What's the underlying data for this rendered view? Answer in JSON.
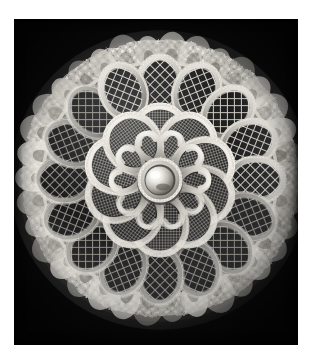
{
  "image": {
    "domain": "Natural-Image",
    "medium": "black and white photograph",
    "subject": "circular handmade lace doily / Irish crochet rosette",
    "background_color": "#060606",
    "mount_color": "#ffffff",
    "highlight_color": "#f2f0ea",
    "midtone_color": "#9b9890",
    "shadow_color": "#2a2a28",
    "photo_field": {
      "x": 14,
      "y": 19,
      "width": 284,
      "height": 326
    }
  },
  "composition": {
    "center": {
      "x": 146,
      "y": 161
    },
    "outer_radius": 150,
    "ruffle_band_width": 26,
    "medallion_ring_radius": 96,
    "petal_ring_radius": 52,
    "boss_radius": 14
  },
  "motifs": {
    "center_boss": {
      "name": "domed pearl boss",
      "radius": 14,
      "highlight_offset": {
        "x": -5,
        "y": -5
      },
      "fill_light": "#f4f2ec",
      "fill_dark": "#6e6b64"
    },
    "inner_petals": {
      "count": 10,
      "shape": "teardrop",
      "fill": "fine square mesh",
      "length": 62,
      "width": 36,
      "mesh_pitch": 3.2,
      "cord_color": "#dcd8cf"
    },
    "outer_medallions": {
      "count": 16,
      "shape": "oval",
      "fill": "coarse diamond mesh",
      "radius_x": 22,
      "radius_y": 28,
      "mesh_pitch": 7,
      "cord_color": "#cfcbc2"
    },
    "ruffle": {
      "name": "gathered lace edging",
      "lobes": 34,
      "amplitude": 9,
      "color_light": "#eae7e0",
      "color_dark": "#55524c"
    }
  },
  "labels": {
    "photo_region": "lace doily photograph",
    "mount_region": "white photographic mount",
    "center_region": "center boss",
    "petal_region": "inner petal ring",
    "medallion_region": "outer medallion ring",
    "ruffle_region": "ruffled lace border"
  }
}
